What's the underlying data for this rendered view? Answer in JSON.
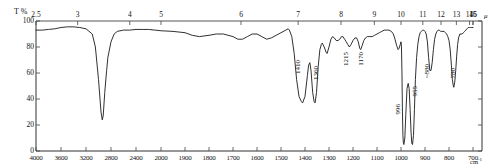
{
  "figure": {
    "type": "ir-spectrum",
    "y_axis_title": "T %",
    "top_axis_unit": "μ",
    "bottom_axis_unit": "cm",
    "bottom_axis_unit_sup": "-1"
  },
  "y_axis": {
    "ticks": [
      "100",
      "80",
      "60",
      "40",
      "20",
      "0"
    ],
    "values": [
      100,
      80,
      60,
      40,
      20,
      0
    ],
    "min": 0,
    "max": 100
  },
  "top_axis": {
    "ticks": [
      "2.5",
      "3",
      "4",
      "5",
      "6",
      "7",
      "8",
      "9",
      "10",
      "11",
      "12",
      "13",
      "14",
      "15",
      "16"
    ],
    "values": [
      2.5,
      3,
      4,
      5,
      6,
      7,
      8,
      9,
      10,
      11,
      12,
      13,
      14,
      15,
      16
    ]
  },
  "bottom_axis": {
    "ticks": [
      "4000",
      "3600",
      "3200",
      "2800",
      "2400",
      "2000",
      "1900",
      "1800",
      "1700",
      "1600",
      "1500",
      "1400",
      "1300",
      "1200",
      "1100",
      "1000",
      "900",
      "800",
      "700"
    ],
    "values": [
      4000,
      3600,
      3200,
      2800,
      2400,
      2000,
      1900,
      1800,
      1700,
      1600,
      1500,
      1400,
      1300,
      1200,
      1100,
      1000,
      900,
      800,
      700
    ]
  },
  "peak_labels": [
    {
      "text": "1410",
      "wavenumber": 1410
    },
    {
      "text": "1360",
      "wavenumber": 1360
    },
    {
      "text": "1215",
      "wavenumber": 1215
    },
    {
      "text": "1170",
      "wavenumber": 1170
    },
    {
      "text": "996",
      "wavenumber": 996
    },
    {
      "text": "955",
      "wavenumber": 955
    },
    {
      "text": "~880",
      "wavenumber": 880
    },
    {
      "text": "780",
      "wavenumber": 780
    }
  ],
  "chart_data": {
    "type": "line",
    "title": "",
    "xlabel": "cm-1",
    "ylabel": "T %",
    "ylim": [
      0,
      100
    ],
    "grid": false,
    "legend": "none",
    "x_axis_note": "Wavenumber scale is piecewise: 4000-2000 compressed, 2000-700 expanded",
    "series": [
      {
        "name": "transmittance",
        "points": [
          [
            4000,
            93
          ],
          [
            3900,
            93
          ],
          [
            3800,
            93.5
          ],
          [
            3700,
            94
          ],
          [
            3600,
            95
          ],
          [
            3500,
            95.5
          ],
          [
            3400,
            95.5
          ],
          [
            3300,
            95
          ],
          [
            3200,
            94
          ],
          [
            3100,
            90
          ],
          [
            3050,
            80
          ],
          [
            3000,
            55
          ],
          [
            2960,
            30
          ],
          [
            2940,
            24
          ],
          [
            2925,
            27
          ],
          [
            2900,
            45
          ],
          [
            2870,
            62
          ],
          [
            2850,
            72
          ],
          [
            2800,
            84
          ],
          [
            2750,
            90
          ],
          [
            2700,
            92
          ],
          [
            2600,
            93
          ],
          [
            2500,
            93
          ],
          [
            2400,
            93.5
          ],
          [
            2300,
            93.5
          ],
          [
            2200,
            93.5
          ],
          [
            2100,
            93
          ],
          [
            2000,
            92.5
          ],
          [
            1950,
            92
          ],
          [
            1900,
            91
          ],
          [
            1870,
            89
          ],
          [
            1840,
            88
          ],
          [
            1800,
            89
          ],
          [
            1770,
            90
          ],
          [
            1740,
            90
          ],
          [
            1700,
            88
          ],
          [
            1680,
            86
          ],
          [
            1660,
            86
          ],
          [
            1640,
            88
          ],
          [
            1620,
            90
          ],
          [
            1600,
            90
          ],
          [
            1580,
            88
          ],
          [
            1560,
            86
          ],
          [
            1540,
            87
          ],
          [
            1520,
            89
          ],
          [
            1500,
            91
          ],
          [
            1480,
            93
          ],
          [
            1470,
            94
          ],
          [
            1465,
            93
          ],
          [
            1455,
            88
          ],
          [
            1445,
            75
          ],
          [
            1435,
            55
          ],
          [
            1425,
            42
          ],
          [
            1415,
            38
          ],
          [
            1410,
            37
          ],
          [
            1400,
            42
          ],
          [
            1390,
            58
          ],
          [
            1385,
            66
          ],
          [
            1380,
            68
          ],
          [
            1375,
            62
          ],
          [
            1368,
            45
          ],
          [
            1362,
            38
          ],
          [
            1358,
            37
          ],
          [
            1352,
            45
          ],
          [
            1345,
            65
          ],
          [
            1338,
            78
          ],
          [
            1332,
            82
          ],
          [
            1328,
            83
          ],
          [
            1320,
            80
          ],
          [
            1312,
            76
          ],
          [
            1308,
            75
          ],
          [
            1300,
            80
          ],
          [
            1292,
            86
          ],
          [
            1285,
            88
          ],
          [
            1278,
            87
          ],
          [
            1270,
            85
          ],
          [
            1262,
            85
          ],
          [
            1255,
            86
          ],
          [
            1248,
            88
          ],
          [
            1242,
            88
          ],
          [
            1235,
            86
          ],
          [
            1228,
            84
          ],
          [
            1222,
            82
          ],
          [
            1215,
            80
          ],
          [
            1208,
            82
          ],
          [
            1200,
            85
          ],
          [
            1192,
            87
          ],
          [
            1185,
            87
          ],
          [
            1178,
            84
          ],
          [
            1172,
            79
          ],
          [
            1168,
            78
          ],
          [
            1162,
            81
          ],
          [
            1155,
            85
          ],
          [
            1148,
            87
          ],
          [
            1140,
            88
          ],
          [
            1130,
            88
          ],
          [
            1120,
            88
          ],
          [
            1110,
            89
          ],
          [
            1100,
            90
          ],
          [
            1090,
            91
          ],
          [
            1080,
            92
          ],
          [
            1070,
            93
          ],
          [
            1060,
            93
          ],
          [
            1050,
            93
          ],
          [
            1040,
            92
          ],
          [
            1032,
            90
          ],
          [
            1025,
            86
          ],
          [
            1018,
            81
          ],
          [
            1012,
            78
          ],
          [
            1008,
            79
          ],
          [
            1003,
            82
          ],
          [
            1000,
            84
          ],
          [
            998,
            80
          ],
          [
            996,
            60
          ],
          [
            994,
            30
          ],
          [
            992,
            12
          ],
          [
            990,
            6
          ],
          [
            988,
            5
          ],
          [
            984,
            10
          ],
          [
            980,
            28
          ],
          [
            975,
            48
          ],
          [
            970,
            52
          ],
          [
            966,
            48
          ],
          [
            962,
            32
          ],
          [
            958,
            14
          ],
          [
            955,
            6
          ],
          [
            952,
            5
          ],
          [
            948,
            12
          ],
          [
            944,
            32
          ],
          [
            940,
            55
          ],
          [
            935,
            72
          ],
          [
            930,
            82
          ],
          [
            925,
            88
          ],
          [
            920,
            91
          ],
          [
            915,
            92
          ],
          [
            910,
            93
          ],
          [
            905,
            93
          ],
          [
            900,
            92
          ],
          [
            895,
            90
          ],
          [
            890,
            84
          ],
          [
            885,
            72
          ],
          [
            880,
            62
          ],
          [
            875,
            62
          ],
          [
            870,
            68
          ],
          [
            865,
            78
          ],
          [
            860,
            86
          ],
          [
            855,
            90
          ],
          [
            850,
            92
          ],
          [
            845,
            93
          ],
          [
            840,
            93
          ],
          [
            835,
            92
          ],
          [
            830,
            92
          ],
          [
            825,
            92
          ],
          [
            820,
            92
          ],
          [
            815,
            91
          ],
          [
            810,
            90
          ],
          [
            805,
            88
          ],
          [
            800,
            85
          ],
          [
            795,
            78
          ],
          [
            790,
            66
          ],
          [
            786,
            55
          ],
          [
            782,
            50
          ],
          [
            780,
            49
          ],
          [
            776,
            53
          ],
          [
            772,
            62
          ],
          [
            768,
            73
          ],
          [
            764,
            82
          ],
          [
            760,
            87
          ],
          [
            755,
            90
          ],
          [
            750,
            90
          ],
          [
            745,
            90
          ],
          [
            740,
            91
          ],
          [
            735,
            92
          ],
          [
            730,
            93
          ],
          [
            725,
            94
          ],
          [
            720,
            95
          ],
          [
            715,
            95
          ],
          [
            710,
            95
          ],
          [
            705,
            95
          ],
          [
            700,
            95
          ]
        ]
      }
    ]
  }
}
